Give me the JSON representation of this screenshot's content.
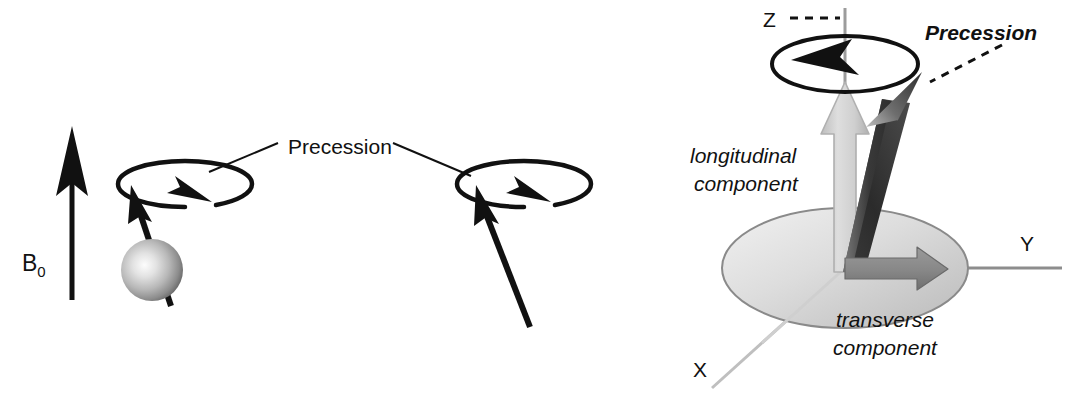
{
  "figure": {
    "background_color": "#ffffff",
    "width": 1070,
    "height": 408
  },
  "colors": {
    "ink": "#111111",
    "axis_gray": "#9a9a9a",
    "axis_dark_gray": "#777777",
    "plane_fill_light": "#e8e8e8",
    "plane_fill_dark": "#bdbdbd",
    "plane_stroke": "#8a8a8a",
    "longitudinal_arrow": "#cfcfcf",
    "longitudinal_arrow_edge": "#b3b3b3",
    "transverse_arrow": "#8c8c8c",
    "transverse_arrow_edge": "#6e6e6e",
    "net_vector_dark": "#2f2f2f",
    "net_vector_light": "#b9b9b9",
    "sphere_highlight": "#fbfbfb",
    "sphere_mid": "#b5b5b5",
    "sphere_shadow": "#5e5e5e"
  },
  "left_panel": {
    "name": "single-spin-precession-panel",
    "field_label": {
      "text": "B",
      "subscript": "0",
      "meaning": "static magnetic field B0"
    },
    "precession_label": "Precession",
    "spin_count": 2,
    "spins": [
      {
        "id": "spin-with-nucleus",
        "has_sphere": true,
        "moment_direction": "up-left",
        "precession_sense": "clockwise-viewed-from-above"
      },
      {
        "id": "spin-without-nucleus",
        "has_sphere": false,
        "moment_direction": "up-left",
        "precession_sense": "clockwise-viewed-from-above"
      }
    ]
  },
  "right_panel": {
    "name": "magnetization-vector-components-panel",
    "axes": [
      {
        "id": "axis-z",
        "label": "Z",
        "orientation": "vertical"
      },
      {
        "id": "axis-y",
        "label": "Y",
        "orientation": "horizontal-right"
      },
      {
        "id": "axis-x",
        "label": "X",
        "orientation": "diagonal-lower-left"
      }
    ],
    "precession_label": "Precession",
    "longitudinal_label_line1": "longitudinal",
    "longitudinal_label_line2": "component",
    "transverse_label_line1": "transverse",
    "transverse_label_line2": "component",
    "net_magnetization": {
      "id": "net-magnetization-vector",
      "description": "tilted bulk magnetization vector"
    },
    "precession_sense": "counter-clockwise-viewed-from-above"
  }
}
